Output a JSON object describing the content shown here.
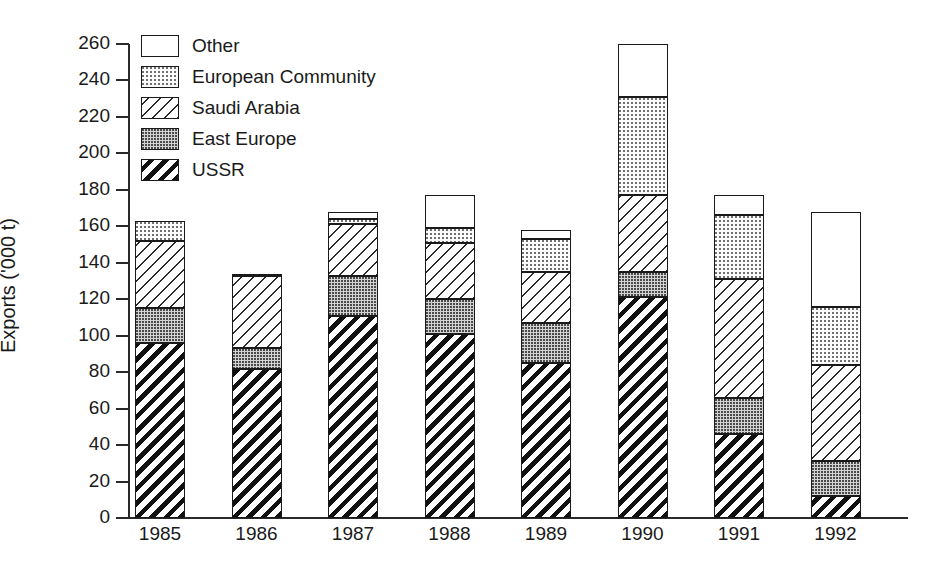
{
  "chart_data": {
    "type": "bar",
    "subtype": "stacked-bar",
    "title": "",
    "xlabel": "",
    "ylabel": "Exports ('000 t)",
    "ylim": [
      0,
      260
    ],
    "ytick_step": 20,
    "yticks": [
      0,
      20,
      40,
      60,
      80,
      100,
      120,
      140,
      160,
      180,
      200,
      220,
      240,
      260
    ],
    "grid": false,
    "legend_position": "top-left",
    "categories": [
      "1985",
      "1986",
      "1987",
      "1988",
      "1989",
      "1990",
      "1991",
      "1992"
    ],
    "series": [
      {
        "name": "USSR",
        "pattern": "dense-black-diagonal-hatch",
        "values": [
          96,
          82,
          111,
          101,
          85,
          121,
          46,
          12
        ]
      },
      {
        "name": "East Europe",
        "pattern": "dense-grey-dots",
        "values": [
          19,
          11,
          22,
          19,
          22,
          14,
          20,
          19
        ]
      },
      {
        "name": "Saudi Arabia",
        "pattern": "light-diagonal-hatch",
        "values": [
          37,
          40,
          28,
          31,
          28,
          42,
          65,
          53
        ]
      },
      {
        "name": "European Community",
        "pattern": "fine-light-dots",
        "values": [
          11,
          1,
          3,
          8,
          18,
          54,
          35,
          32
        ]
      },
      {
        "name": "Other",
        "pattern": "white",
        "values": [
          0,
          0,
          4,
          18,
          5,
          29,
          11,
          52
        ]
      }
    ],
    "totals": [
      163,
      134,
      168,
      177,
      158,
      260,
      177,
      168
    ],
    "cumulative_tops": [
      {
        "year": "1985",
        "USSR": 96,
        "East Europe": 115,
        "Saudi Arabia": 152,
        "European Community": 163,
        "Other": 163
      },
      {
        "year": "1986",
        "USSR": 82,
        "East Europe": 93,
        "Saudi Arabia": 133,
        "European Community": 134,
        "Other": 134
      },
      {
        "year": "1987",
        "USSR": 111,
        "East Europe": 133,
        "Saudi Arabia": 161,
        "European Community": 164,
        "Other": 168
      },
      {
        "year": "1988",
        "USSR": 101,
        "East Europe": 120,
        "Saudi Arabia": 151,
        "European Community": 159,
        "Other": 177
      },
      {
        "year": "1989",
        "USSR": 85,
        "East Europe": 107,
        "Saudi Arabia": 135,
        "European Community": 153,
        "Other": 158
      },
      {
        "year": "1990",
        "USSR": 121,
        "East Europe": 135,
        "Saudi Arabia": 177,
        "European Community": 231,
        "Other": 260
      },
      {
        "year": "1991",
        "USSR": 46,
        "East Europe": 66,
        "Saudi Arabia": 131,
        "European Community": 166,
        "Other": 177
      },
      {
        "year": "1992",
        "USSR": 12,
        "East Europe": 31,
        "Saudi Arabia": 84,
        "European Community": 116,
        "Other": 168
      }
    ]
  },
  "axis": {
    "y_title": "Exports ('000 t)"
  },
  "legend": {
    "items": [
      {
        "label": "Other",
        "pattern": "white"
      },
      {
        "label": "European Community",
        "pattern": "fine-light-dots"
      },
      {
        "label": "Saudi Arabia",
        "pattern": "light-diagonal-hatch"
      },
      {
        "label": "East Europe",
        "pattern": "dense-grey-dots"
      },
      {
        "label": "USSR",
        "pattern": "dense-black-diagonal-hatch"
      }
    ]
  },
  "colors": {
    "axis": "#1a1a1a",
    "background": "#ffffff",
    "hatch": "#111111",
    "dots_light": "#6f6f6f",
    "dots_dense_bg": "#d4d4d4"
  }
}
